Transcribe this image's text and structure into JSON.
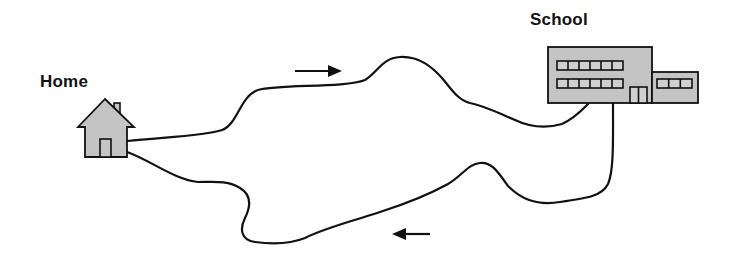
{
  "diagram": {
    "labels": {
      "home": "Home",
      "school": "School"
    },
    "icons": {
      "home": "house-icon",
      "school": "school-building-icon",
      "arrow_top": "arrow-right-icon",
      "arrow_bottom": "arrow-left-icon"
    },
    "colors": {
      "stroke": "#111111",
      "building_fill": "#c4c4c4",
      "window_fill": "#d0d0d0",
      "background": "#ffffff"
    },
    "routes": [
      {
        "name": "route-to-school",
        "direction": "Home → School"
      },
      {
        "name": "route-to-home",
        "direction": "School → Home"
      }
    ]
  }
}
